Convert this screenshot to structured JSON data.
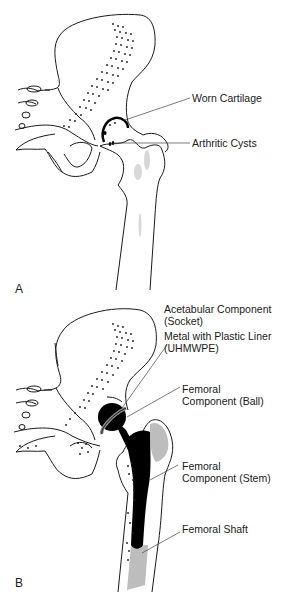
{
  "figure": {
    "panels": [
      {
        "letter": "A",
        "description": "Arthritic hip joint",
        "labels": [
          {
            "text": "Worn Cartilage"
          },
          {
            "text": "Arthritic Cysts"
          }
        ]
      },
      {
        "letter": "B",
        "description": "Total hip replacement",
        "labels": [
          {
            "line1": "Acetabular Component",
            "line2": "(Socket)"
          },
          {
            "line1": "Metal with Plastic Liner",
            "line2": "(UHMWPE)"
          },
          {
            "line1": "Femoral",
            "line2": "Component (Ball)"
          },
          {
            "line1": "Femoral",
            "line2": "Component (Stem)"
          },
          {
            "text": "Femoral Shaft"
          }
        ]
      }
    ],
    "colors": {
      "line": "#1a1a1a",
      "implant": "#000000",
      "cancellous_shading": "#bdbdbd",
      "background": "#ffffff"
    }
  }
}
